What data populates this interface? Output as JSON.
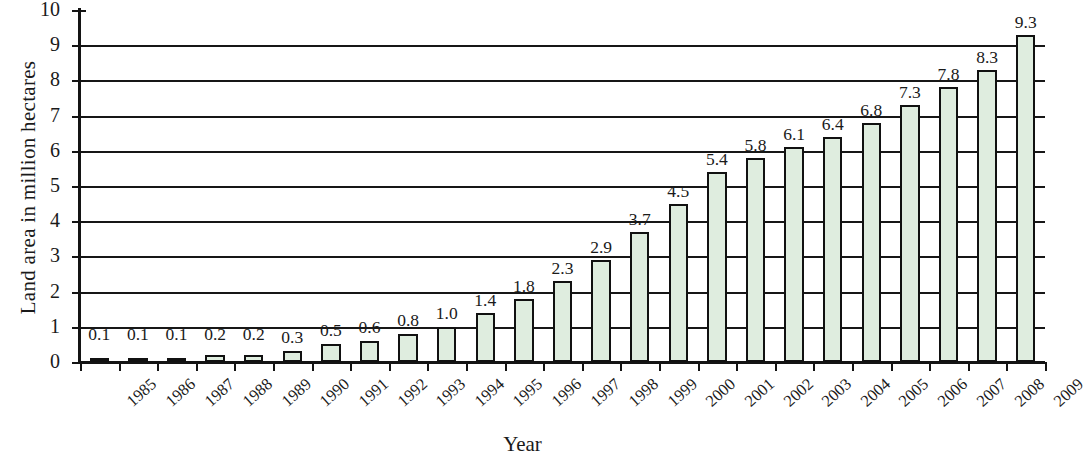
{
  "chart_data": {
    "type": "bar",
    "title": "",
    "xlabel": "Year",
    "ylabel": "Land area in million hectares",
    "categories": [
      "1985",
      "1986",
      "1987",
      "1988",
      "1989",
      "1990",
      "1991",
      "1992",
      "1993",
      "1994",
      "1995",
      "1996",
      "1997",
      "1998",
      "1999",
      "2000",
      "2001",
      "2002",
      "2003",
      "2004",
      "2005",
      "2006",
      "2007",
      "2008",
      "2009"
    ],
    "values": [
      0.1,
      0.1,
      0.1,
      0.2,
      0.2,
      0.3,
      0.5,
      0.6,
      0.8,
      1.0,
      1.4,
      1.8,
      2.3,
      2.9,
      3.7,
      4.5,
      5.4,
      5.8,
      6.1,
      6.4,
      6.8,
      7.3,
      7.8,
      8.3,
      9.3
    ],
    "value_labels": [
      "0.1",
      "0.1",
      "0.1",
      "0.2",
      "0.2",
      "0.3",
      "0.5",
      "0.6",
      "0.8",
      "1.0",
      "1.4",
      "1.8",
      "2.3",
      "2.9",
      "3.7",
      "4.5",
      "5.4",
      "5.8",
      "6.1",
      "6.4",
      "6.8",
      "7.3",
      "7.8",
      "8.3",
      "9.3"
    ],
    "ylim": [
      0,
      10
    ],
    "ytick_labels": [
      "0",
      "1",
      "2",
      "3",
      "4",
      "5",
      "6",
      "7",
      "8",
      "9",
      "10"
    ],
    "ytick_values": [
      0,
      1,
      2,
      3,
      4,
      5,
      6,
      7,
      8,
      9,
      10
    ],
    "grid": true,
    "grid_axis": "y",
    "legend": "none",
    "bar_fill_color": "#dfeddf",
    "bar_edge_color": "#111111",
    "axis_color": "#141414"
  }
}
